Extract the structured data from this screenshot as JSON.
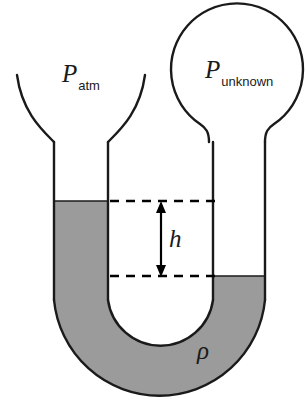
{
  "figure": {
    "labels": {
      "left_pressure_symbol": "P",
      "left_pressure_subscript": "atm",
      "right_pressure_symbol": "P",
      "right_pressure_subscript": "unknown",
      "height_symbol": "h",
      "density_symbol": "ρ"
    },
    "colors": {
      "fluid_fill": "#9b9b9b",
      "outline": "#1a1a1a",
      "background": "#ffffff",
      "dash_line": "#000000",
      "arrow": "#000000"
    },
    "geometry": {
      "left_tube_outer_x": 54,
      "left_tube_inner_x": 108,
      "right_tube_inner_x": 213,
      "right_tube_outer_x": 265,
      "left_fluid_level_y": 201,
      "right_fluid_level_y": 276,
      "upper_dash_y": 201,
      "lower_dash_y": 276,
      "arrow_x": 161,
      "bulb_center_x": 237,
      "bulb_center_y": 77,
      "bulb_radius": 66,
      "u_bend_outer_bottom_y": 398,
      "u_bend_inner_bottom_y": 340
    }
  }
}
